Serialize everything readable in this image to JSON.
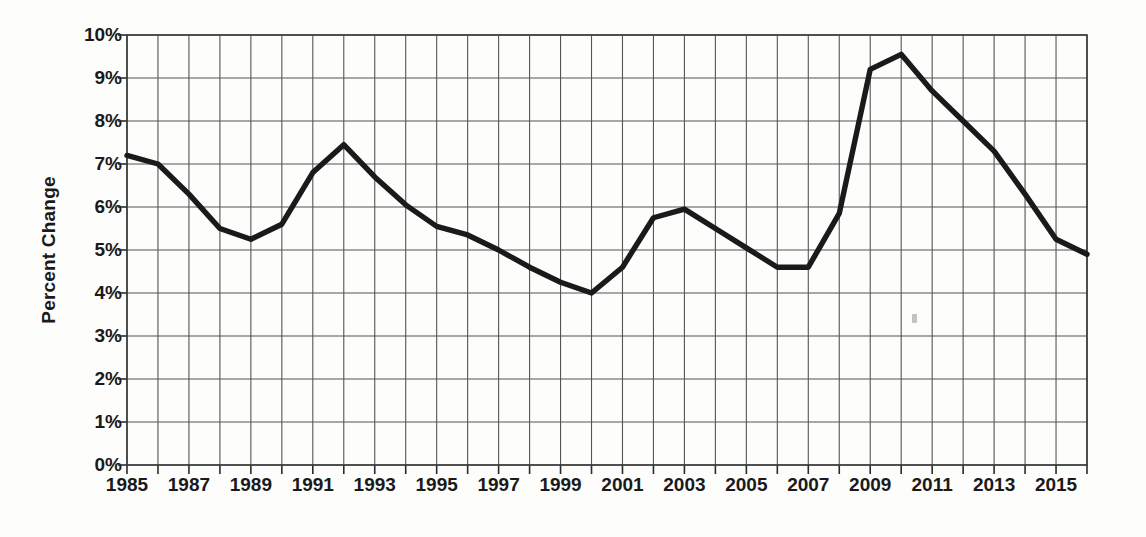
{
  "chart_data": {
    "type": "line",
    "title": "",
    "xlabel": "",
    "ylabel": "Percent Change",
    "xlim": [
      1985,
      2016
    ],
    "ylim": [
      0,
      10
    ],
    "grid": true,
    "legend": "none",
    "y_tick_labels": [
      "0%",
      "1%",
      "2%",
      "3%",
      "4%",
      "5%",
      "6%",
      "7%",
      "8%",
      "9%",
      "10%"
    ],
    "y_tick_values": [
      0,
      1,
      2,
      3,
      4,
      5,
      6,
      7,
      8,
      9,
      10
    ],
    "x_tick_labels": [
      "1985",
      "1987",
      "1989",
      "1991",
      "1993",
      "1995",
      "1997",
      "1999",
      "2001",
      "2003",
      "2005",
      "2007",
      "2009",
      "2011",
      "2013",
      "2015"
    ],
    "x_tick_values": [
      1985,
      1987,
      1989,
      1991,
      1993,
      1995,
      1997,
      1999,
      2001,
      2003,
      2005,
      2007,
      2009,
      2011,
      2013,
      2015
    ],
    "x": [
      1985,
      1986,
      1987,
      1988,
      1989,
      1990,
      1991,
      1992,
      1993,
      1994,
      1995,
      1996,
      1997,
      1998,
      1999,
      2000,
      2001,
      2002,
      2003,
      2004,
      2005,
      2006,
      2007,
      2008,
      2009,
      2010,
      2011,
      2012,
      2013,
      2014,
      2015,
      2016
    ],
    "values": [
      7.2,
      7.0,
      6.3,
      5.5,
      5.25,
      5.6,
      6.8,
      7.45,
      6.7,
      6.05,
      5.55,
      5.35,
      5.0,
      4.6,
      4.25,
      4.0,
      4.6,
      5.75,
      5.95,
      5.5,
      5.05,
      4.6,
      4.6,
      5.85,
      9.2,
      9.55,
      8.7,
      8.0,
      7.3,
      6.3,
      5.25,
      4.9
    ],
    "series_name": "Percent Change",
    "line_color": "#1a1a1a",
    "grid_color": "#555555",
    "background_color": "#ffffff"
  },
  "figure": {
    "axis_title_y": "Percent Change"
  }
}
